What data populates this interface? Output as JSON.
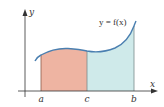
{
  "diagram": {
    "curve_label": "y = f(x)",
    "axes": {
      "x_label": "x",
      "y_label": "y"
    },
    "ticks": [
      {
        "label": "a"
      },
      {
        "label": "c"
      },
      {
        "label": "b"
      }
    ],
    "regions": [
      {
        "name": "left-region",
        "from": "a",
        "to": "c",
        "color": "#eeb4a2"
      },
      {
        "name": "right-region",
        "from": "c",
        "to": "b",
        "color": "#cfeaea"
      }
    ],
    "colors": {
      "curve": "#4a7fb0",
      "axis": "#333333",
      "boundary_line": "#8a5a4a"
    }
  }
}
